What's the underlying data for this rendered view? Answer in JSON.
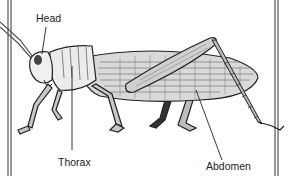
{
  "diagram": {
    "labels": [
      {
        "id": "head",
        "text": "Head",
        "x": 36,
        "y": 12
      },
      {
        "id": "thorax",
        "text": "Thorax",
        "x": 58,
        "y": 163
      },
      {
        "id": "abdomen",
        "text": "Abdomen",
        "x": 234,
        "y": 173
      }
    ],
    "colors": {
      "ink": "#222222",
      "shade": "#9a9a9a",
      "light": "#e6e6e6",
      "background": "#ffffff"
    }
  }
}
